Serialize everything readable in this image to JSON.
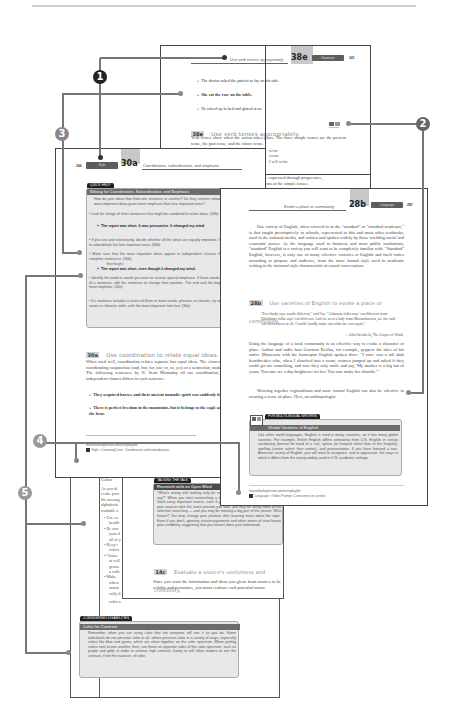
{
  "callouts": [
    {
      "id": "1",
      "label": "1"
    },
    {
      "id": "2",
      "label": "2"
    },
    {
      "id": "3",
      "label": "3"
    },
    {
      "id": "4",
      "label": "4"
    },
    {
      "id": "5",
      "label": "5"
    }
  ],
  "page_38e": {
    "header_title": "Use verb tenses appropriately",
    "section": "38e",
    "tab": "Grammar",
    "page_number": "301",
    "examples": [
      "The doctor asked the patient to lay on his side.",
      "She sat the vase on the table.",
      "He raised up in bed and glared at us."
    ],
    "heading_badge": "38e",
    "heading": "Use verb tenses appropriately.",
    "multilingual_icon_label": "Multilingual",
    "body": "Verb tenses show when the action takes place. The three simple tenses are the present tense, the past tense, and the future tense.",
    "partial_lines": [
      "write",
      "wrote",
      "I will write",
      "e expressed through progressive,",
      "rms of the simple tenses."
    ]
  },
  "page_30a": {
    "page_number": "306",
    "tab": "Style",
    "section": "30a",
    "header_title": "Coordination, subordination, and emphasis",
    "quick_help": {
      "tab": "QUICK HELP",
      "title": "Editing for Coordination, Subordination, and Emphasis",
      "intro": "How do your ideas flow from one sentence to another? Do they connect smoothly and clearly? Are the most important ideas given more emphasis than less important ones?",
      "bullets": [
        "Look for strings of short sentences that might be combined to relate ideas. (30b)",
        "If you use and excessively, decide whether all the ideas are equally important. If they are not equal, edit to subordinate the less important ones. (30b)",
        "Make sure that the most important ideas appear in independent clauses that can stand alone as complete sentences. (30b)",
        "Identify the word or words you want to receive special emphasis. If those words are buried in the middle of a sentence, edit the sentence to change their position. The end and the beginning are generally the most emphatic. (30e)",
        "If a sentence includes a series of three or more words, phrases, or clauses, try to arrange the items in the series in climactic order, with the most important item last. (30e)"
      ],
      "example_1": "The report was short. It was persuasive. It changed my mind.",
      "example_1_edits": [
        "which",
        "it"
      ],
      "example_2_edit": "Even though it",
      "example_2": "The report was short, even though it changed my mind."
    },
    "section_badge": "30a",
    "section_heading": "Use coordination to relate equal ideas.",
    "body": "When used well, coordination relates separate but equal ideas. The element that links the ideas, usually a coordinating conjunction (and, but, for, nor, or, so, yet) or a semicolon, makes the precise relationship clear. The following sentences by N. Scott Momaday all use coordination, but the relationship between independent clauses differs in each sentence.",
    "examples": [
      "They acquired horses, and their ancient nomadic spirit was suddenly free of the ground.",
      "There is perfect freedom in the mountains, but it belongs to the eagle and the elk, the badger and the bear."
    ],
    "url": "macmillanhighered.com/everydaylife",
    "footer_link": "Style > LearningCurve: Coordination and subordination"
  },
  "page_28b": {
    "header_title": "Evoke a place or community",
    "section": "28b",
    "tab": "Language",
    "page_number": "287",
    "paragraph_1": "One variety of English, often referred to as the \"standard\" or \"standard academic,\" is that taught prescriptively in schools, represented in this and most other textbooks, used in the national media, and written and spoken widely by those wielding social and economic power. As the language used in business and most public institutions, \"standard\" English is a variety you will want to be completely familiar with. \"Standard\" English, however, is only one of many effective varieties of English and itself varies according to purpose and audience, from the more formal style used in academic writing to the informal style characteristic of casual conversation.",
    "heading_badge": "28b",
    "heading": "Use varieties of English to evoke a place or community.",
    "quote": "\"Ever'body says words different,\" said Ivy. \"Arkansas folks says 'em different from Oklahomy folks says 'em different. And we seen a lady from Massachusetts, an' she said 'em differentest of all. Couldn' hardly make out what she was sayin'.\"",
    "attribution": "—John Steinbeck, The Grapes of Wrath",
    "paragraph_2": "Using the language of a local community is an effective way to evoke a character or place. Author and radio host Garrison Keillor, for example, peppers his tales of his native Minnesota with the homespun English spoken there: \"I once was a tall dark heartbreaker who, when I slouched into a room, women jumped up and asked if they could get me something, and now they only smile and say, 'My mother is a big fan of yours. You sure are a day-brightener for her. You sure make her chuckle.'\"",
    "paragraph_3": "Weaving together regionalisms and more formal English can also be effective in creating a sense of place. Here, an anthropologist",
    "multilingual_box": {
      "tab": "FOR MULTILINGUAL WRITERS",
      "title": "Global Varieties of English",
      "text": "Like other world languages, English is used in many countries, so it has many global varieties. For example, British English differs somewhat from U.S. English in certain vocabulary (bonnet for hood of a car), syntax (to hospital rather than to the hospital), spelling (centre rather than center), and pronunciation. If you have learned a non-American variety of English, you will want to recognize, and to appreciate, the ways in which it differs from the variety widely used in U.S. academic settings."
    },
    "url": "macmillanhighered.com/everydaylife",
    "footer_link": "Language > Video Prompt: Correctness in context"
  },
  "page_14c": {
    "partial_top": "tions will be most useful for you.",
    "talking_box": {
      "tab": "TALKING THE TALK",
      "title": "Research with an Open Mind",
      "text": "\"What's wrong with looking only for sources that agree with what I want to say?\" When you start researching a topic, keep an open mind throughout. Seek every important source, even if you think you won't agree with it. If all your sources take the same position you take, you may be doing some pretty selective searching — and you may be missing a big part of the picture. Who knows? You may change your position after learning more about the topic. Even if you don't, ignoring counterarguments and other points of view harms your credibility, suggesting that you haven't done your homework."
    },
    "heading_badge": "14c",
    "heading": "Evaluate a source's usefulness and credibility.",
    "body": "Since you want the information and ideas you glean from sources to be reliable and persuasive, you must evaluate each potential source"
  },
  "page_color": {
    "heading": "Color",
    "intro_lines": [
      "As you de",
      "evoke pow",
      "the messag",
      "alphabetic",
      "readable a"
    ],
    "bullets": [
      [
        "Use co",
        "headir"
      ],
      [
        "Be con",
        "your d",
        "all of y"
      ],
      [
        "Keep t",
        "colors"
      ],
      [
        "Choos",
        "or coll",
        "groun",
        "a wide"
      ],
      [
        "Make",
        "where",
        "monit",
        "cally d"
      ]
    ],
    "partial_bottom": "color a",
    "disabilities_box": {
      "tab": "CONSIDERING DISABILITIES",
      "title": "Color for Contrast",
      "text": "Remember when you are using color that not everyone will see it as you do. Some individuals do not perceive color at all; others perceive color in a variety of ways, especially colors like blue and green, which are close together on the color spectrum. When putting colors next to one another, then, use those on opposite sides of the color spectrum, such as purple and gold, in order to achieve high contrast. Doing so will allow readers to see the contrast, if not the nuances, of color."
    }
  }
}
